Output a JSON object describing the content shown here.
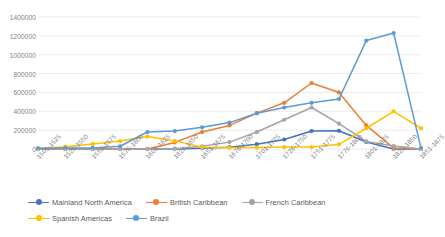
{
  "chart_data": {
    "type": "line",
    "title": "",
    "xlabel": "",
    "ylabel": "",
    "ylim": [
      0,
      1400000
    ],
    "ytick_step": 200000,
    "grid": true,
    "legend_position": "bottom",
    "categories": [
      "1501-1525",
      "1526-1550",
      "1551-1575",
      "1576-1600",
      "1601-1625",
      "1626-1650",
      "1651-1675",
      "1676-1700",
      "1701-1725",
      "1726-1750",
      "1751-1775",
      "1776-1800",
      "1801-1825",
      "1826-1850",
      "1851-1875"
    ],
    "yticks": [
      "0",
      "200000",
      "400000",
      "600000",
      "800000",
      "1000000",
      "1200000",
      "1400000"
    ],
    "series": [
      {
        "name": "Mainland North America",
        "color": "#4472C4",
        "values": [
          0,
          0,
          0,
          0,
          0,
          1000,
          8000,
          19000,
          51000,
          101000,
          190000,
          193000,
          74000,
          1000,
          0
        ]
      },
      {
        "name": "British Caribbean",
        "color": "#ED7D31",
        "values": [
          0,
          0,
          0,
          0,
          0,
          70000,
          180000,
          250000,
          380000,
          490000,
          700000,
          600000,
          250000,
          10000,
          0
        ]
      },
      {
        "name": "French Caribbean",
        "color": "#A5A5A5",
        "values": [
          0,
          0,
          0,
          0,
          0,
          3000,
          29000,
          73000,
          180000,
          310000,
          440000,
          270000,
          80000,
          31000,
          0
        ]
      },
      {
        "name": "Spanish Americas",
        "color": "#FFC000",
        "values": [
          6000,
          25000,
          54000,
          84000,
          132000,
          86000,
          18000,
          14000,
          15000,
          20000,
          21000,
          50000,
          220000,
          400000,
          220000
        ]
      },
      {
        "name": "Brazil",
        "color": "#5B9BD5",
        "values": [
          7000,
          10000,
          11000,
          29000,
          180000,
          190000,
          230000,
          280000,
          380000,
          440000,
          490000,
          530000,
          1150000,
          1230000,
          10000
        ]
      }
    ]
  }
}
